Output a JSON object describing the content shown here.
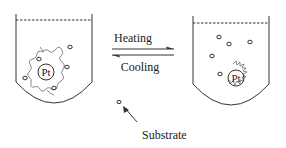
{
  "diagram": {
    "type": "reversible-process-schematic",
    "labels": {
      "forward": "Heating",
      "reverse": "Cooling",
      "substrate": "Substrate",
      "catalyst_left": "Pt",
      "catalyst_right": "Pt"
    },
    "left_beaker": {
      "description": "Pt particle wrapped by polymer coil, substrates nearby",
      "substrate_count": 5
    },
    "right_beaker": {
      "description": "Pt particle with collapsed/spiky polymer shell, substrates free in solution",
      "substrate_count": 5
    },
    "colors": {
      "line": "#333333",
      "background": "#ffffff"
    }
  }
}
